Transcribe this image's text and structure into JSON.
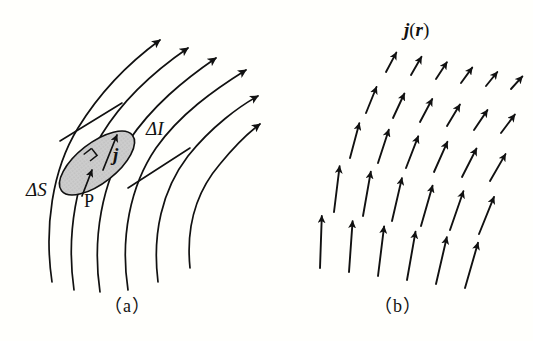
{
  "figure": {
    "width": 533,
    "height": 341,
    "background_color": "#fffffc",
    "ink_color": "#111111"
  },
  "panel_a": {
    "name": "current-density-through-surface",
    "caption": "（a）",
    "labels": {
      "delta_i": "ΔI",
      "delta_s": "ΔS",
      "current_density_vector": "j",
      "point": "P"
    },
    "shaded_surface": {
      "fill_color": "#c9c9c9",
      "stroke_color": "#111111",
      "center_x": 97,
      "center_y": 163,
      "radius_x": 45,
      "radius_y": 20,
      "rotation_deg": -38
    },
    "right_angle_marker": {
      "present": true,
      "size": 9
    },
    "flow_lines": [
      {
        "d": "M 52,282 C 44,228 52,170 78,128 C 100,92 130,62 160,40"
      },
      {
        "d": "M 74,290 C 66,234 76,176 102,134 C 124,98 156,70 188,48"
      },
      {
        "d": "M 100,292 C 92,238 102,182 128,142 C 152,106 184,80 216,58"
      },
      {
        "d": "M 128,290 C 120,238 130,186 156,148 C 180,114 214,90 246,70"
      },
      {
        "d": "M 158,282 C 152,234 162,190 188,156 C 212,124 244,102 258,94"
      },
      {
        "d": "M 190,270 C 186,228 196,192 220,162 C 240,138 252,126 258,120"
      }
    ],
    "flow_arrow_count": 6,
    "cross_section_lines": [
      {
        "x1": 60,
        "y1": 140,
        "x2": 120,
        "y2": 104
      },
      {
        "x1": 126,
        "y1": 186,
        "x2": 185,
        "y2": 147
      }
    ]
  },
  "panel_b": {
    "name": "current-density-vector-field",
    "caption": "（b）",
    "label_field": "j(r)",
    "label_parts": {
      "symbol": "j",
      "open_paren": "(",
      "argument": "r",
      "close_paren": ")"
    },
    "rows": 5,
    "cols": 6,
    "vector_field": [
      {
        "row": 0,
        "x": 386,
        "y": 72,
        "length": 22,
        "angle_deg": -62
      },
      {
        "row": 0,
        "x": 411,
        "y": 75,
        "length": 21,
        "angle_deg": -60
      },
      {
        "row": 0,
        "x": 436,
        "y": 79,
        "length": 20,
        "angle_deg": -57
      },
      {
        "row": 0,
        "x": 461,
        "y": 83,
        "length": 19,
        "angle_deg": -54
      },
      {
        "row": 0,
        "x": 486,
        "y": 86,
        "length": 18,
        "angle_deg": -51
      },
      {
        "row": 0,
        "x": 511,
        "y": 89,
        "length": 17,
        "angle_deg": -48
      },
      {
        "row": 1,
        "x": 366,
        "y": 113,
        "length": 28,
        "angle_deg": -68
      },
      {
        "row": 1,
        "x": 393,
        "y": 118,
        "length": 27,
        "angle_deg": -65
      },
      {
        "row": 1,
        "x": 420,
        "y": 122,
        "length": 26,
        "angle_deg": -62
      },
      {
        "row": 1,
        "x": 447,
        "y": 126,
        "length": 25,
        "angle_deg": -59
      },
      {
        "row": 1,
        "x": 474,
        "y": 130,
        "length": 24,
        "angle_deg": -56
      },
      {
        "row": 1,
        "x": 501,
        "y": 133,
        "length": 23,
        "angle_deg": -53
      },
      {
        "row": 2,
        "x": 350,
        "y": 158,
        "length": 36,
        "angle_deg": -75
      },
      {
        "row": 2,
        "x": 378,
        "y": 163,
        "length": 35,
        "angle_deg": -72
      },
      {
        "row": 2,
        "x": 406,
        "y": 168,
        "length": 34,
        "angle_deg": -69
      },
      {
        "row": 2,
        "x": 434,
        "y": 172,
        "length": 33,
        "angle_deg": -66
      },
      {
        "row": 2,
        "x": 462,
        "y": 177,
        "length": 32,
        "angle_deg": -63
      },
      {
        "row": 2,
        "x": 490,
        "y": 181,
        "length": 31,
        "angle_deg": -60
      },
      {
        "row": 3,
        "x": 334,
        "y": 212,
        "length": 46,
        "angle_deg": -83
      },
      {
        "row": 3,
        "x": 363,
        "y": 216,
        "length": 45,
        "angle_deg": -80
      },
      {
        "row": 3,
        "x": 392,
        "y": 221,
        "length": 44,
        "angle_deg": -77
      },
      {
        "row": 3,
        "x": 421,
        "y": 226,
        "length": 42,
        "angle_deg": -74
      },
      {
        "row": 3,
        "x": 450,
        "y": 230,
        "length": 41,
        "angle_deg": -71
      },
      {
        "row": 3,
        "x": 479,
        "y": 234,
        "length": 40,
        "angle_deg": -68
      },
      {
        "row": 4,
        "x": 320,
        "y": 268,
        "length": 52,
        "angle_deg": -88
      },
      {
        "row": 4,
        "x": 349,
        "y": 272,
        "length": 51,
        "angle_deg": -86
      },
      {
        "row": 4,
        "x": 378,
        "y": 276,
        "length": 50,
        "angle_deg": -83
      },
      {
        "row": 4,
        "x": 407,
        "y": 280,
        "length": 49,
        "angle_deg": -80
      },
      {
        "row": 4,
        "x": 436,
        "y": 284,
        "length": 48,
        "angle_deg": -77
      },
      {
        "row": 4,
        "x": 465,
        "y": 288,
        "length": 47,
        "angle_deg": -74
      }
    ]
  }
}
